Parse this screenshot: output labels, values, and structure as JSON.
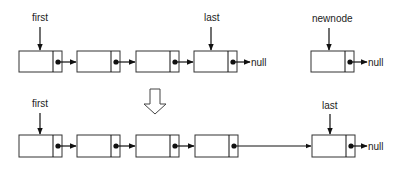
{
  "diagram": {
    "colors": {
      "stroke": "#333333",
      "fill": "#ffffff",
      "text": "#222222"
    },
    "before": {
      "pointer_first": "first",
      "pointer_last": "last",
      "pointer_newnode": "newnode",
      "nodes": [
        {
          "id": "n1",
          "x": 19,
          "y": 51
        },
        {
          "id": "n2",
          "x": 77,
          "y": 51
        },
        {
          "id": "n3",
          "x": 136,
          "y": 51
        },
        {
          "id": "n4",
          "x": 194,
          "y": 51
        }
      ],
      "last_null": "null",
      "newnode_box": {
        "x": 311,
        "y": 51
      },
      "newnode_null": "null"
    },
    "transition_arrow": "down-arrow",
    "after": {
      "pointer_first": "first",
      "pointer_last": "last",
      "nodes": [
        {
          "id": "n1",
          "x": 19,
          "y": 135
        },
        {
          "id": "n2",
          "x": 77,
          "y": 135
        },
        {
          "id": "n3",
          "x": 136,
          "y": 135
        },
        {
          "id": "n4",
          "x": 195,
          "y": 135
        },
        {
          "id": "n5",
          "x": 312,
          "y": 135
        }
      ],
      "last_null": "null"
    }
  }
}
